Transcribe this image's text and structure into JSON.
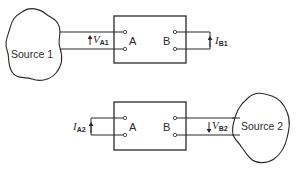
{
  "diagram": {
    "top": {
      "source_label": "Source 1",
      "port_a_label": "A",
      "port_b_label": "B",
      "voltage": {
        "symbol": "V",
        "subscript": "A1",
        "at_port": "A"
      },
      "current": {
        "symbol": "I",
        "subscript": "B1",
        "at_port": "B"
      }
    },
    "bottom": {
      "source_label": "Source 2",
      "port_a_label": "A",
      "port_b_label": "B",
      "current": {
        "symbol": "I",
        "subscript": "A2",
        "at_port": "A"
      },
      "voltage": {
        "symbol": "V",
        "subscript": "B2",
        "at_port": "B"
      }
    }
  }
}
